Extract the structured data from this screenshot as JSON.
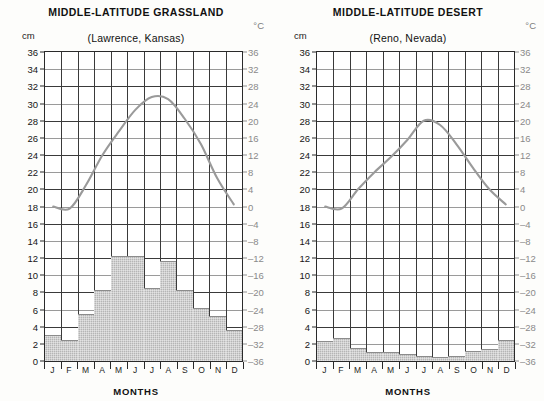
{
  "figure": {
    "months_axis_label": "MONTHS",
    "left_unit": "cm",
    "right_unit": "°C"
  },
  "panels": [
    {
      "id": "grassland",
      "title": "MIDDLE-LATITUDE GRASSLAND",
      "subtitle": "(Lawrence, Kansas)",
      "left_unit": "cm",
      "right_unit": "°C",
      "months_axis_label": "MONTHS"
    },
    {
      "id": "desert",
      "title": "MIDDLE-LATITUDE DESERT",
      "subtitle": "(Reno, Nevada)",
      "left_unit": "cm",
      "right_unit": "°C",
      "months_axis_label": "MONTHS"
    }
  ],
  "axes": {
    "months": [
      "J",
      "F",
      "M",
      "A",
      "M",
      "J",
      "J",
      "A",
      "S",
      "O",
      "N",
      "D"
    ],
    "precip_ticks": [
      "36",
      "34",
      "32",
      "30",
      "28",
      "26",
      "24",
      "22",
      "20",
      "18",
      "16",
      "14",
      "12",
      "10",
      "8",
      "6",
      "4",
      "2",
      "0"
    ],
    "temp_ticks": [
      "36",
      "32",
      "28",
      "24",
      "20",
      "16",
      "12",
      "8",
      "4",
      "0",
      "-4",
      "-8",
      "-12",
      "-16",
      "-20",
      "-24",
      "-28",
      "-32",
      "-36"
    ],
    "precip_range": [
      0,
      36
    ],
    "temp_range": [
      -36,
      36
    ]
  },
  "colors": {
    "bar_fill": "#b5b5b5",
    "bar_edge": "#8c8c8c",
    "temp_line": "#9a9a9a",
    "grid": "#3a3a3a",
    "frame": "#2a2a2a",
    "right_axis_text": "#8a8a8a"
  },
  "chart_data": [
    {
      "type": "bar",
      "title": "MIDDLE-LATITUDE GRASSLAND",
      "subtitle": "(Lawrence, Kansas)",
      "xlabel": "MONTHS",
      "ylabel": "cm",
      "y2label": "°C",
      "categories": [
        "J",
        "F",
        "M",
        "A",
        "M",
        "J",
        "J",
        "A",
        "S",
        "O",
        "N",
        "D"
      ],
      "ylim": [
        0,
        36
      ],
      "y2lim": [
        -36,
        36
      ],
      "grid": true,
      "legend": "none",
      "series": [
        {
          "name": "Precipitation (cm)",
          "kind": "bar",
          "axis": "left",
          "values": [
            3.0,
            2.5,
            5.5,
            8.3,
            12.2,
            12.2,
            8.5,
            11.7,
            8.3,
            6.2,
            5.2,
            3.6
          ]
        },
        {
          "name": "Temperature (°C)",
          "kind": "line",
          "axis": "right",
          "values": [
            0.0,
            -0.5,
            5.0,
            12.0,
            17.5,
            22.5,
            25.5,
            25.0,
            20.5,
            14.5,
            6.5,
            0.5
          ]
        }
      ]
    },
    {
      "type": "bar",
      "title": "MIDDLE-LATITUDE DESERT",
      "subtitle": "(Reno, Nevada)",
      "xlabel": "MONTHS",
      "ylabel": "cm",
      "y2label": "°C",
      "categories": [
        "J",
        "F",
        "M",
        "A",
        "M",
        "J",
        "J",
        "A",
        "S",
        "O",
        "N",
        "D"
      ],
      "ylim": [
        0,
        36
      ],
      "y2lim": [
        -36,
        36
      ],
      "grid": true,
      "legend": "none",
      "series": [
        {
          "name": "Precipitation (cm)",
          "kind": "bar",
          "axis": "left",
          "values": [
            2.3,
            2.7,
            1.5,
            1.0,
            1.1,
            0.8,
            0.6,
            0.5,
            0.6,
            1.2,
            1.4,
            2.5
          ]
        },
        {
          "name": "Temperature (°C)",
          "kind": "line",
          "axis": "right",
          "values": [
            0.0,
            -0.5,
            4.0,
            8.0,
            11.5,
            15.5,
            20.0,
            19.0,
            14.5,
            9.0,
            4.0,
            0.5
          ]
        }
      ]
    }
  ]
}
